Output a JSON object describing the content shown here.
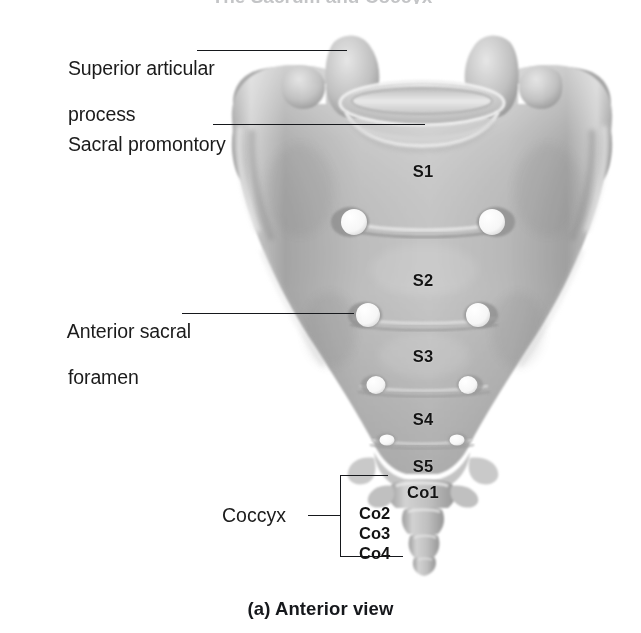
{
  "figure": {
    "title_cropped": "The Sacrum and Coccyx",
    "caption": "(a) Anterior view",
    "width": 641,
    "height": 633
  },
  "callouts": [
    {
      "id": "superior-articular-process",
      "line1": "Superior articular",
      "line2": "process",
      "text": "Superior articular process"
    },
    {
      "id": "sacral-promontory",
      "line1": "Sacral promontory",
      "line2": "",
      "text": "Sacral promontory"
    },
    {
      "id": "anterior-sacral-foramen",
      "line1": "Anterior sacral",
      "line2": "foramen",
      "text": "Anterior sacral foramen"
    }
  ],
  "bracket": {
    "label": "Coccyx",
    "segments": [
      "Co2",
      "Co3",
      "Co4"
    ],
    "segment_1": "Co2",
    "segment_2": "Co3",
    "segment_3": "Co4"
  },
  "vertebrae": [
    {
      "id": "s1",
      "label": "S1"
    },
    {
      "id": "s2",
      "label": "S2"
    },
    {
      "id": "s3",
      "label": "S3"
    },
    {
      "id": "s4",
      "label": "S4"
    },
    {
      "id": "s5",
      "label": "S5"
    },
    {
      "id": "co1",
      "label": "Co1"
    }
  ],
  "colors": {
    "background": "#ffffff",
    "text": "#1b1b1b",
    "leader_line": "#16181c",
    "bone_light": "#e2e2e2",
    "bone_mid": "#b9b9b9",
    "bone_shadow": "#8e8e8e",
    "foramen": "#fbfbfb"
  }
}
